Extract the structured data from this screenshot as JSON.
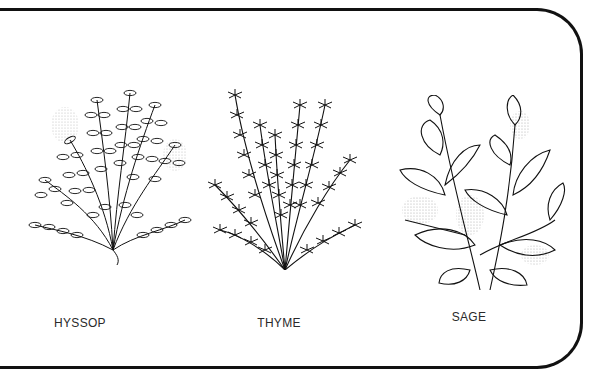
{
  "illustration": {
    "plants": [
      {
        "id": "hyssop",
        "label": "HYSSOP",
        "center_x": 80
      },
      {
        "id": "thyme",
        "label": "THYME",
        "center_x": 279
      },
      {
        "id": "sage",
        "label": "SAGE",
        "center_x": 469
      }
    ],
    "colors": {
      "ink": "#111111",
      "stipple": "#bdbdbd",
      "background": "#ffffff"
    }
  }
}
